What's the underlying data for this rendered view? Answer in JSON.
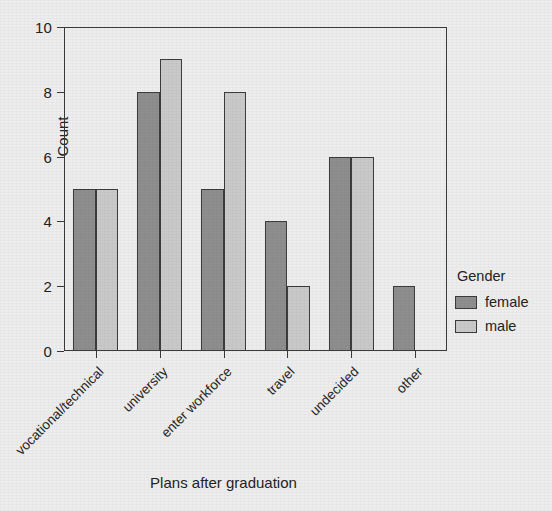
{
  "chart_data": {
    "type": "bar",
    "title": "",
    "xlabel": "Plans after graduation",
    "ylabel": "Count",
    "categories": [
      "vocational/technical",
      "university",
      "enter workforce",
      "travel",
      "undecided",
      "other"
    ],
    "series": [
      {
        "name": "female",
        "values": [
          5,
          8,
          5,
          4,
          6,
          2
        ],
        "color": "#8e8e8e"
      },
      {
        "name": "male",
        "values": [
          5,
          9,
          8,
          2,
          6,
          0
        ],
        "color": "#c9c9c9"
      }
    ],
    "ylim": [
      0,
      10
    ],
    "yticks": [
      0,
      2,
      4,
      6,
      8,
      10
    ],
    "ytick_labels": [
      "0",
      "2",
      "4",
      "6",
      "8",
      "10"
    ],
    "grid": false,
    "legend": {
      "title": "Gender",
      "position": "right",
      "entries": [
        {
          "label": "female",
          "color": "#8e8e8e"
        },
        {
          "label": "male",
          "color": "#c9c9c9"
        }
      ]
    },
    "style": {
      "background": "#ededed",
      "axis_color": "#3a3a3a",
      "text_color": "#232323",
      "bar_border": "#3c3c3c"
    }
  }
}
